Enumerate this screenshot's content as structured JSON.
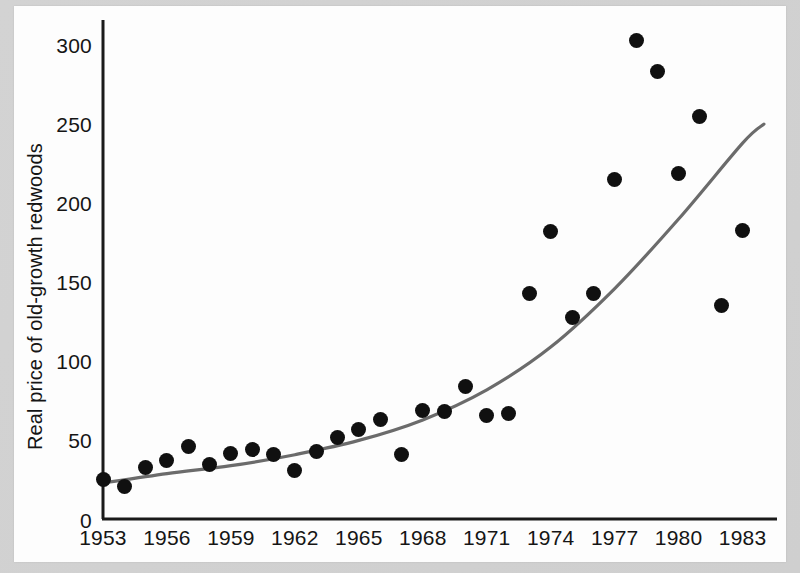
{
  "chart_data": {
    "type": "scatter",
    "title": "",
    "subtitle": "",
    "xlabel": "",
    "ylabel": "Real price of old-growth redwoods",
    "xlim": [
      1952.3,
      1984.5
    ],
    "ylim": [
      0,
      320
    ],
    "grid": false,
    "legend": null,
    "x_tick_labels": [
      "1953",
      "1956",
      "1959",
      "1962",
      "1965",
      "1968",
      "1971",
      "1974",
      "1977",
      "1980",
      "1983"
    ],
    "x_ticks": [
      1953,
      1956,
      1959,
      1962,
      1965,
      1968,
      1971,
      1974,
      1977,
      1980,
      1983
    ],
    "y_tick_labels": [
      "0",
      "50",
      "100",
      "150",
      "200",
      "250",
      "300"
    ],
    "y_ticks": [
      0,
      50,
      100,
      150,
      200,
      250,
      300
    ],
    "marker_color": "#101010",
    "trend_color": "#6b6b6b",
    "axis_color": "#1a1a1a",
    "background_color": "#fdfdfd",
    "x": [
      1953,
      1954,
      1955,
      1956,
      1957,
      1958,
      1959,
      1960,
      1961,
      1962,
      1963,
      1964,
      1965,
      1966,
      1967,
      1968,
      1969,
      1970,
      1971,
      1972,
      1973,
      1974,
      1975,
      1976,
      1977,
      1978,
      1979,
      1980,
      1981,
      1982,
      1983
    ],
    "values": [
      25,
      21,
      33,
      37,
      46,
      35,
      42,
      44,
      41,
      31,
      43,
      52,
      57,
      63,
      41,
      69,
      68,
      84,
      66,
      67,
      143,
      182,
      128,
      143,
      215,
      303,
      283,
      219,
      255,
      135,
      183
    ],
    "series": [
      {
        "name": "Real price of old-growth redwoods",
        "type": "scatter",
        "values": [
          25,
          21,
          33,
          37,
          46,
          35,
          42,
          44,
          41,
          31,
          43,
          52,
          57,
          63,
          41,
          69,
          68,
          84,
          66,
          67,
          143,
          182,
          128,
          143,
          215,
          303,
          283,
          219,
          255,
          135,
          183
        ]
      },
      {
        "name": "fitted exponential trend",
        "type": "line",
        "x": [
          1953,
          1956,
          1959,
          1962,
          1965,
          1968,
          1971,
          1974,
          1977,
          1980,
          1983,
          1984
        ],
        "values": [
          23,
          29,
          34,
          41,
          50,
          63,
          82,
          109,
          146,
          190,
          238,
          250
        ]
      }
    ]
  },
  "axis": {
    "y_title": "Real price of old-growth redwoods"
  }
}
